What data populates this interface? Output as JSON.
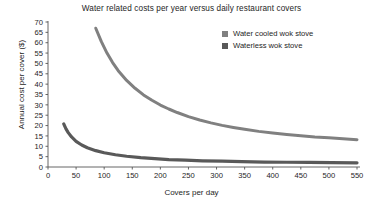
{
  "chart_data": {
    "type": "line",
    "title": "Water related costs per year versus daily restaurant covers",
    "xlabel": "Covers per day",
    "ylabel": "Annual cost per cover ($)",
    "xlim": [
      0,
      550
    ],
    "ylim": [
      0,
      70
    ],
    "xticks": [
      0,
      50,
      100,
      150,
      200,
      250,
      300,
      350,
      400,
      450,
      500,
      550
    ],
    "yticks": [
      0,
      5,
      10,
      15,
      20,
      25,
      30,
      35,
      40,
      45,
      50,
      55,
      60,
      65,
      70
    ],
    "grid": false,
    "legend_position": "top-right",
    "series": [
      {
        "name": "Water cooled wok stove",
        "color": "#808080",
        "x": [
          85,
          95,
          105,
          115,
          125,
          140,
          155,
          170,
          185,
          200,
          215,
          230,
          250,
          270,
          290,
          310,
          330,
          350,
          375,
          400,
          425,
          450,
          475,
          500,
          525,
          550
        ],
        "values": [
          67.0,
          60.5,
          55.0,
          50.4,
          46.5,
          41.8,
          38.0,
          34.8,
          32.2,
          29.9,
          28.0,
          26.3,
          24.3,
          22.7,
          21.3,
          20.1,
          19.1,
          18.2,
          17.2,
          16.4,
          15.7,
          15.1,
          14.5,
          14.1,
          13.6,
          13.2
        ]
      },
      {
        "name": "Waterless wok stove",
        "color": "#595959",
        "x": [
          28,
          32,
          36,
          42,
          50,
          60,
          70,
          85,
          100,
          120,
          140,
          165,
          190,
          215,
          245,
          275,
          310,
          345,
          385,
          425,
          465,
          505,
          550
        ],
        "values": [
          20.8,
          18.4,
          16.6,
          14.5,
          12.4,
          10.6,
          9.3,
          7.9,
          6.9,
          5.9,
          5.2,
          4.5,
          4.0,
          3.6,
          3.3,
          3.0,
          2.8,
          2.6,
          2.4,
          2.3,
          2.2,
          2.1,
          2.0
        ]
      }
    ]
  }
}
